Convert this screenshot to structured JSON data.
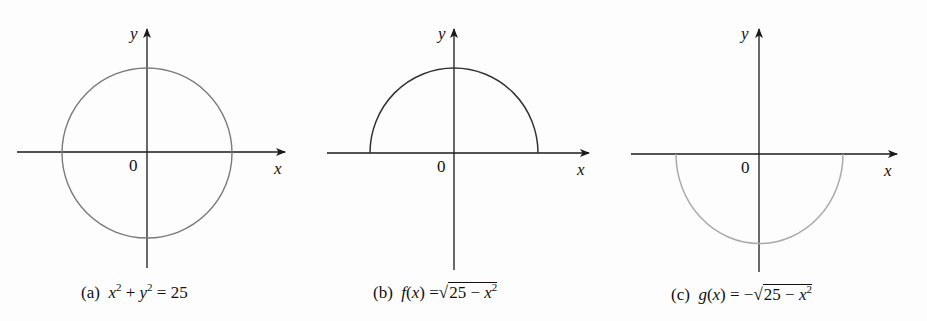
{
  "panels": [
    {
      "id": "a",
      "caption_prefix": "(a)",
      "caption_equation": "x² + y² = 25",
      "caption_parts": {
        "x": "x",
        "sup1": "2",
        "plus": "+",
        "y": "y",
        "sup2": "2",
        "eq": "= 25"
      },
      "curve": "full circle",
      "curve_color": "#7a7a7a",
      "x_label": "x",
      "y_label": "y",
      "origin_label": "0"
    },
    {
      "id": "b",
      "caption_prefix": "(b)",
      "caption_equation": "f(x) = √(25 − x²)",
      "caption_parts": {
        "f": "f",
        "lp": "(",
        "x": "x",
        "rp": ")",
        "eq": "=",
        "radical": "√",
        "radicand": "25 − ",
        "rx": "x",
        "sup": "2"
      },
      "curve": "upper semicircle",
      "curve_color": "#333333",
      "x_label": "x",
      "y_label": "y",
      "origin_label": "0"
    },
    {
      "id": "c",
      "caption_prefix": "(c)",
      "caption_equation": "g(x) = −√(25 − x²)",
      "caption_parts": {
        "g": "g",
        "lp": "(",
        "x": "x",
        "rp": ")",
        "eq": "= −",
        "radical": "√",
        "radicand": "25 − ",
        "rx": "x",
        "sup": "2"
      },
      "curve": "lower semicircle",
      "curve_color": "#aaaaaa",
      "x_label": "x",
      "y_label": "y",
      "origin_label": "0"
    }
  ],
  "colors": {
    "axis": "#1a1a1a",
    "background": "#fdfdfd"
  }
}
